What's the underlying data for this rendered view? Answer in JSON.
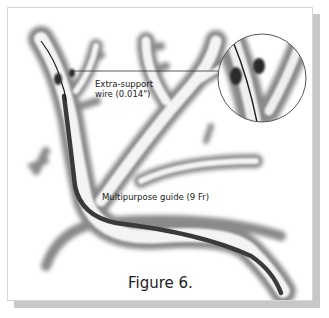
{
  "figure": {
    "caption": "Figure 6.",
    "labels": {
      "wire_line1": "Extra-support",
      "wire_line2": "wire (0.014\")",
      "guide": "Multipurpose guide (9 Fr)"
    },
    "icons": {
      "vessel": "vessel-tree-illustration",
      "magnifier": "magnified-inset-circle"
    },
    "colors": {
      "vessel_shade": "#8a8a8a",
      "vessel_light": "#f2f2f2",
      "guide_catheter": "#3a3a3a",
      "wire": "#1a1a1a",
      "frame_shadow": "#c8c8c8"
    }
  }
}
